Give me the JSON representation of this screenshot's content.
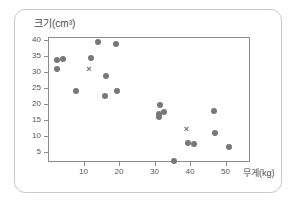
{
  "chart_data": {
    "type": "scatter",
    "title": "",
    "ylabel": "크기(cm³)",
    "xlabel": "무게(kg)",
    "xlim": [
      0,
      56.9
    ],
    "ylim": [
      1.9,
      40.9
    ],
    "xticks": [
      10,
      20,
      30,
      40,
      50
    ],
    "yticks": [
      40,
      35,
      30,
      25,
      20,
      15,
      10,
      5
    ],
    "grid": false,
    "legend": null,
    "series": [
      {
        "name": "데이터",
        "marker": "circle",
        "color": "#77777b",
        "points": [
          {
            "x": 2.6,
            "y": 33.8
          },
          {
            "x": 4.3,
            "y": 34.0
          },
          {
            "x": 2.6,
            "y": 31.0
          },
          {
            "x": 7.9,
            "y": 24.0
          },
          {
            "x": 12.2,
            "y": 34.5
          },
          {
            "x": 14.2,
            "y": 39.3
          },
          {
            "x": 16.2,
            "y": 28.8
          },
          {
            "x": 16.1,
            "y": 22.4
          },
          {
            "x": 19.2,
            "y": 38.7
          },
          {
            "x": 19.3,
            "y": 24.0
          },
          {
            "x": 31.5,
            "y": 19.8
          },
          {
            "x": 31.3,
            "y": 17.0
          },
          {
            "x": 31.3,
            "y": 16.0
          },
          {
            "x": 32.8,
            "y": 17.6
          },
          {
            "x": 35.4,
            "y": 2.2
          },
          {
            "x": 39.4,
            "y": 7.8
          },
          {
            "x": 41.0,
            "y": 7.5
          },
          {
            "x": 46.8,
            "y": 17.9
          },
          {
            "x": 47.0,
            "y": 11.0
          },
          {
            "x": 50.9,
            "y": 6.7
          }
        ]
      },
      {
        "name": "평균",
        "marker": "x",
        "color": "#6f6f73",
        "points": [
          {
            "x": 11.5,
            "y": 31.0
          },
          {
            "x": 39.0,
            "y": 12.3
          }
        ]
      }
    ]
  }
}
